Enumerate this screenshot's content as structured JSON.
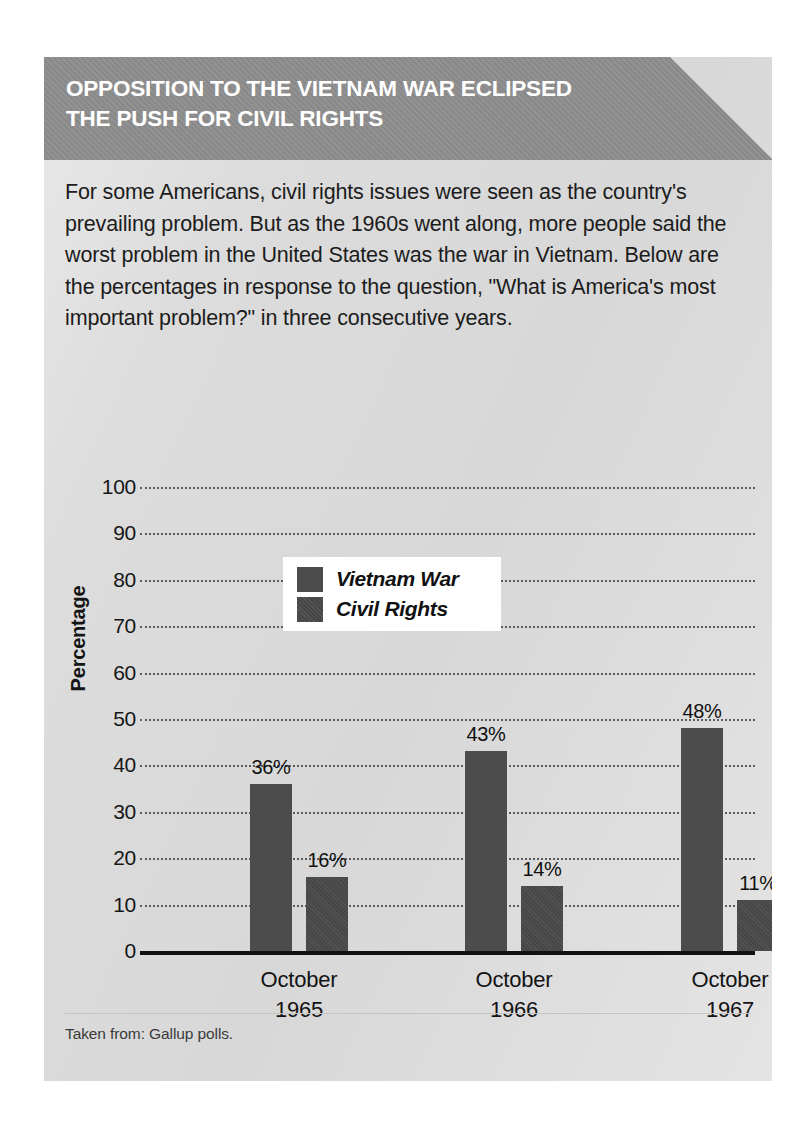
{
  "header": {
    "title": "OPPOSITION TO THE VIETNAM WAR ECLIPSED\nTHE PUSH FOR CIVIL RIGHTS",
    "background_color": "#8d8d8d",
    "text_color": "#ffffff"
  },
  "intro": {
    "text": "For some Americans, civil rights issues were seen as the country's prevailing problem. But as the 1960s went along, more people said the worst problem in the United States was the war in Vietnam. Below are the percentages in response to the question, \"What is America's most important problem?\" in three consecutive years."
  },
  "footer": {
    "source_note": "Taken from: Gallup polls."
  },
  "card": {
    "background_color": "#dcdcdc"
  },
  "chart_data": {
    "type": "bar",
    "title": "",
    "xlabel": "",
    "ylabel": "Percentage",
    "ylim": [
      0,
      100
    ],
    "ytick_labels": [
      "100",
      "90",
      "80",
      "70",
      "60",
      "50",
      "40",
      "30",
      "20",
      "10",
      "0"
    ],
    "ytick_values": [
      100,
      90,
      80,
      70,
      60,
      50,
      40,
      30,
      20,
      10,
      0
    ],
    "grid": true,
    "grid_style": "dotted-horizontal",
    "legend_position": "upper-left-inside",
    "bar_color": "#4c4c4c",
    "categories": [
      "October\n1965",
      "October\n1966",
      "October\n1967"
    ],
    "series": [
      {
        "name": "Vietnam War",
        "values": [
          36,
          43,
          48
        ],
        "data_labels": [
          "36%",
          "43%",
          "48%"
        ],
        "color": "#4c4c4c"
      },
      {
        "name": "Civil Rights",
        "values": [
          16,
          14,
          11
        ],
        "data_labels": [
          "16%",
          "14%",
          "11%"
        ],
        "color": "#4a4a4a"
      }
    ]
  }
}
